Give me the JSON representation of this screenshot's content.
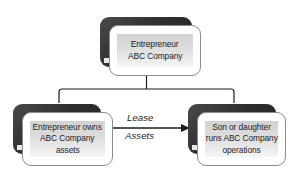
{
  "diagram": {
    "background_color": "#ffffff",
    "line_color": "#1c1c1c",
    "backplate_color": "#2e2e2e",
    "card_fill_color": "#ffffff",
    "panel_fill_color": "#dcdcdc",
    "text_color": "#1c1c1c",
    "nodes": [
      {
        "id": "top",
        "name": "entrepreneur-abc-company",
        "lines": [
          "Entrepreneur",
          "ABC Company"
        ]
      },
      {
        "id": "owner",
        "name": "entrepreneur-owns-assets",
        "lines": [
          "Entrepreneur owns",
          "ABC Company",
          "assets"
        ]
      },
      {
        "id": "operator",
        "name": "son-or-daughter-runs-operations",
        "lines": [
          "Son or daughter",
          "runs ABC Company",
          "operations"
        ]
      }
    ],
    "edges": [
      {
        "id": "lease-assets",
        "name": "lease-assets-arrow",
        "from": "owner",
        "to": "operator",
        "label_lines": [
          "Lease",
          "Assets"
        ],
        "arrowhead": "right"
      },
      {
        "id": "top-split",
        "name": "hierarchy-connector",
        "from": "top",
        "to": [
          "owner",
          "operator"
        ],
        "style": "orthogonal-tee"
      }
    ]
  }
}
